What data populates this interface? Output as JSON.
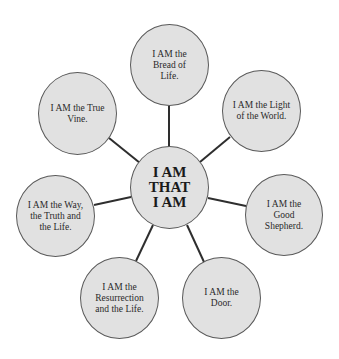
{
  "diagram": {
    "type": "radial-concept-map",
    "center": {
      "label": "I AM\nTHAT\nI AM",
      "lines": [
        "I AM",
        "THAT",
        "I AM"
      ]
    },
    "nodes": [
      {
        "id": "bread",
        "label": "I AM the Bread of Life."
      },
      {
        "id": "light",
        "label": "I AM the Light of the World."
      },
      {
        "id": "shepherd",
        "label": "I AM the Good Shepherd."
      },
      {
        "id": "door",
        "label": "I AM the Door."
      },
      {
        "id": "resurrection",
        "label": "I AM the Resurrection and the Life."
      },
      {
        "id": "way",
        "label": "I AM the Way, the Truth and the Life."
      },
      {
        "id": "vine",
        "label": "I AM the True Vine."
      }
    ],
    "colors": {
      "node_fill": "#e1e1e1",
      "node_border": "#5a5a5a",
      "connector": "#2e2e2e",
      "background": "#ffffff"
    }
  }
}
